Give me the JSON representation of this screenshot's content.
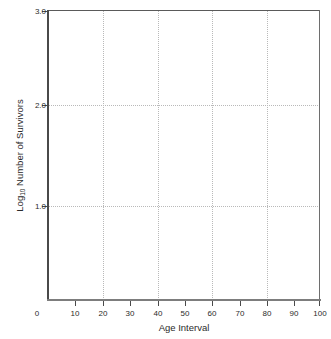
{
  "chart_data": {
    "type": "line",
    "title": "",
    "subtitle": "",
    "xlabel": "Age Interval",
    "ylabel": "Log10 Number of Survivors",
    "ylabel_base": "Log",
    "ylabel_subscript": "10",
    "ylabel_rest": " Number of Survivors",
    "xlim": [
      2,
      102
    ],
    "ylim": [
      0.07,
      3.0
    ],
    "x_ticks": [
      0,
      10,
      20,
      30,
      40,
      50,
      60,
      70,
      80,
      90,
      100
    ],
    "x_tick_labels": [
      "0",
      "10",
      "20",
      "30",
      "40",
      "50",
      "60",
      "70",
      "80",
      "90",
      "100"
    ],
    "y_ticks": [
      1.0,
      2.0,
      3.0
    ],
    "y_tick_labels": [
      "1.0",
      "2.0",
      "3.0"
    ],
    "grid": true,
    "grid_style": "dotted",
    "grid_x_values": [
      20,
      40,
      60,
      80
    ],
    "grid_y_values": [
      1.0,
      2.0
    ],
    "legend": null,
    "legend_position": "none",
    "series": [],
    "x": [],
    "values": [],
    "annotations": [],
    "note": "Empty plot frame: axes, ticks and gridlines only, no data plotted"
  },
  "colors": {
    "axis": "#4a4a4a",
    "axis_bottom": "#7d7d7d",
    "frame": "#6e6e6e",
    "grid": "#b9b9b9",
    "text": "#2b2b2b",
    "background": "#ffffff"
  }
}
